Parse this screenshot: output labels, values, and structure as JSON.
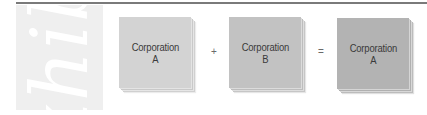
{
  "figure": {
    "side_watermark": "Exhibit",
    "equation": {
      "terms": [
        {
          "line1": "Corporation",
          "line2": "A",
          "fill": "#d3d3d3"
        },
        {
          "line1": "Corporation",
          "line2": "B",
          "fill": "#c2c2c2"
        },
        {
          "line1": "Corporation",
          "line2": "A",
          "fill": "#b3b3b3"
        }
      ],
      "operators": [
        "+",
        "="
      ]
    }
  },
  "colors": {
    "rule": "#7a7a7a",
    "side_strip": "#efefef",
    "text": "#3a3a3a"
  }
}
